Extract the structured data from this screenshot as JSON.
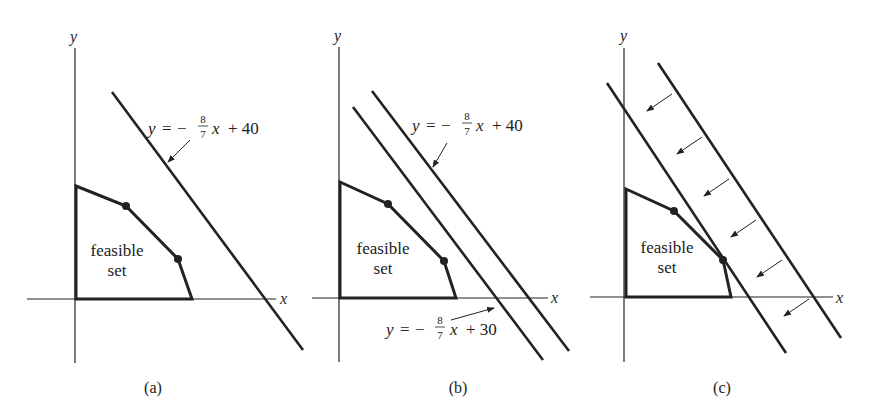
{
  "panels": [
    {
      "caption": "(a)",
      "axis_x": "x",
      "axis_y": "y",
      "region_label_1": "feasible",
      "region_label_2": "set",
      "line_labels": [
        {
          "y": "y",
          "eq": "=",
          "minus": "−",
          "num": "8",
          "den": "7",
          "x": "x",
          "rest": "+ 40"
        }
      ]
    },
    {
      "caption": "(b)",
      "axis_x": "x",
      "axis_y": "y",
      "region_label_1": "feasible",
      "region_label_2": "set",
      "line_labels": [
        {
          "y": "y",
          "eq": "=",
          "minus": "−",
          "num": "8",
          "den": "7",
          "x": "x",
          "rest": "+ 40"
        },
        {
          "y": "y",
          "eq": "=",
          "minus": "−",
          "num": "8",
          "den": "7",
          "x": "x",
          "rest": "+ 30"
        }
      ]
    },
    {
      "caption": "(c)",
      "axis_x": "x",
      "axis_y": "y",
      "region_label_1": "feasible",
      "region_label_2": "set",
      "line_labels": []
    }
  ],
  "colors": {
    "ink": "#222222",
    "background": "#ffffff"
  }
}
